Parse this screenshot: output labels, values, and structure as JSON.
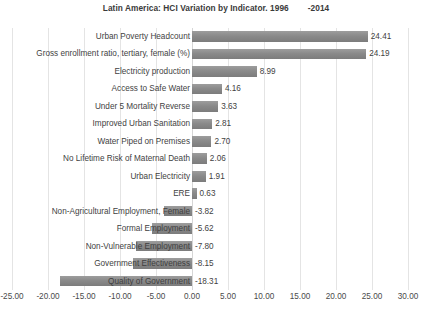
{
  "chart_data": {
    "type": "bar",
    "orientation": "horizontal",
    "title": "Latin America: HCI Variation by Indicator. 1996        -2014",
    "title_parts": {
      "main": "Latin America: HCI Variation by Indicator. 1996",
      "suffix": "-2014"
    },
    "xlabel": "",
    "ylabel": "",
    "xlim": [
      -25.0,
      30.0
    ],
    "xtick_step": 5.0,
    "grid": true,
    "legend": "none",
    "bar_color": "#8a8a8a",
    "gridline_color": "#e4e4e4",
    "text_color": "#3f3f3f",
    "xticks": [
      "-25.00",
      "-20.00",
      "-15.00",
      "-10.00",
      "-5.00",
      "0.00",
      "5.00",
      "10.00",
      "15.00",
      "20.00",
      "25.00",
      "30.00"
    ],
    "categories": [
      "Urban Poverty Headcount",
      "Gross enrollment ratio, tertiary, female (%)",
      "Electricity production",
      "Access to Safe Water",
      "Under 5 Mortality Reverse",
      "Improved Urban Sanitation",
      "Water Piped on Premises",
      "No Lifetime Risk of Maternal Death",
      "Urban Electricity",
      "ERE",
      "Non-Agricultural Employment, Female",
      "Formal Employment",
      "Non-Vulnerable Employment",
      "Government Effectiveness",
      "Quality of Government"
    ],
    "values": [
      24.41,
      24.19,
      8.99,
      4.16,
      3.63,
      2.81,
      2.7,
      2.06,
      1.91,
      0.63,
      -3.82,
      -5.62,
      -7.8,
      -8.15,
      -18.31
    ],
    "value_labels": [
      "24.41",
      "24.19",
      "8.99",
      "4.16",
      "3.63",
      "2.81",
      "2.70",
      "2.06",
      "1.91",
      "0.63",
      "-3.82",
      "-5.62",
      "-7.80",
      "-8.15",
      "-18.31"
    ]
  }
}
